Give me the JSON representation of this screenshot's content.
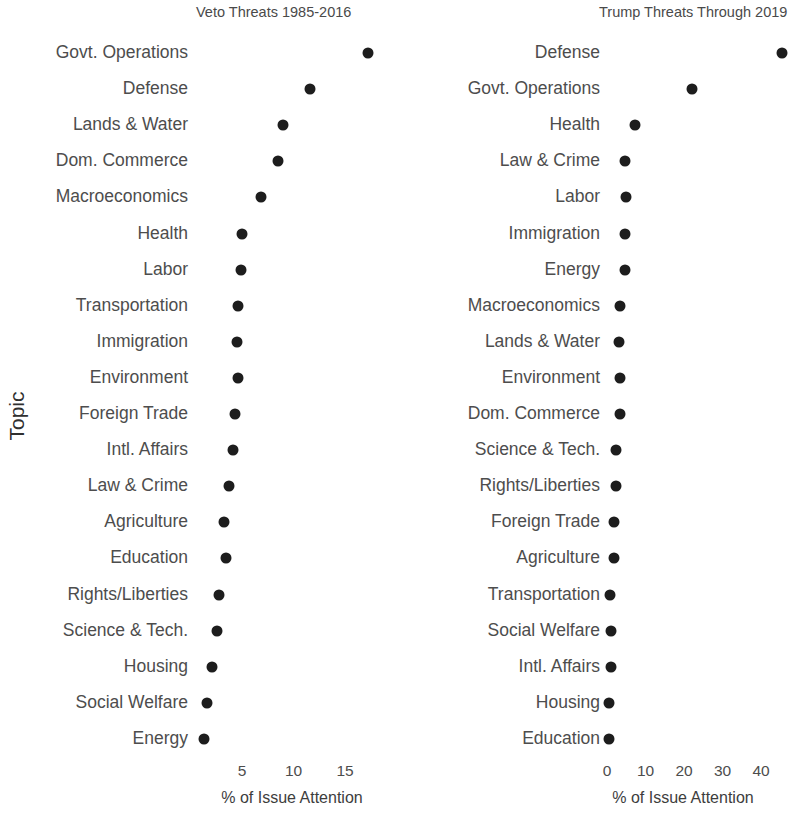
{
  "figure": {
    "yaxis_label": "Topic",
    "background_color": "#ffffff",
    "dot_color": "#1d1d1d",
    "text_color": "#4d4d4d"
  },
  "chart_data": [
    {
      "type": "scatter",
      "panel": "left",
      "title": "Veto Threats 1985-2016",
      "xlabel": "% of Issue Attention",
      "ylabel": "Topic",
      "grid": false,
      "legend": "none",
      "xticks": [
        5,
        10,
        15
      ],
      "xtick_labels": [
        "5",
        "10",
        "15"
      ],
      "xlim": [
        0.4,
        18.5
      ],
      "categories": [
        "Govt. Operations",
        "Defense",
        "Lands & Water",
        "Dom. Commerce",
        "Macroeconomics",
        "Health",
        "Labor",
        "Transportation",
        "Immigration",
        "Environment",
        "Foreign Trade",
        "Intl. Affairs",
        "Law & Crime",
        "Agriculture",
        "Education",
        "Rights/Liberties",
        "Science & Tech.",
        "Housing",
        "Social Welfare",
        "Energy"
      ],
      "values": [
        17.2,
        11.6,
        9.0,
        8.5,
        6.8,
        5.0,
        4.9,
        4.6,
        4.5,
        4.6,
        4.3,
        4.1,
        3.7,
        3.3,
        3.4,
        2.8,
        2.6,
        2.1,
        1.6,
        1.3
      ]
    },
    {
      "type": "scatter",
      "panel": "right",
      "title": "Trump Threats Through 2019",
      "xlabel": "% of Issue Attention",
      "ylabel": "Topic",
      "grid": false,
      "legend": "none",
      "xticks": [
        0,
        10,
        20,
        30,
        40
      ],
      "xtick_labels": [
        "0",
        "10",
        "20",
        "30",
        "40"
      ],
      "xlim": [
        -1.5,
        47
      ],
      "categories": [
        "Defense",
        "Govt. Operations",
        "Health",
        "Law & Crime",
        "Labor",
        "Immigration",
        "Energy",
        "Macroeconomics",
        "Lands & Water",
        "Environment",
        "Dom. Commerce",
        "Science & Tech.",
        "Rights/Liberties",
        "Foreign Trade",
        "Agriculture",
        "Transportation",
        "Social Welfare",
        "Intl. Affairs",
        "Housing",
        "Education"
      ],
      "values": [
        45.5,
        22.1,
        7.3,
        4.7,
        4.9,
        4.7,
        4.7,
        3.4,
        3.1,
        3.4,
        3.4,
        2.3,
        2.3,
        1.8,
        1.8,
        0.8,
        1.0,
        1.0,
        0.5,
        0.5
      ]
    }
  ]
}
